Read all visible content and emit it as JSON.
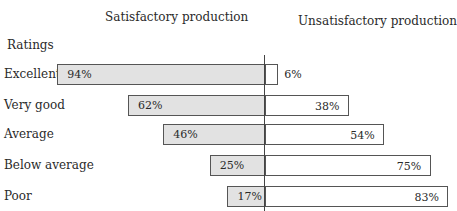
{
  "chart_data": {
    "type": "bar",
    "subtype": "diverging-horizontal",
    "title": "",
    "left_series_title": "Satisfactory production",
    "right_series_title": "Unsatisfactory production",
    "category_axis_title": "Ratings",
    "categories": [
      "Excellent",
      "Very good",
      "Average",
      "Below average",
      "Poor"
    ],
    "series": [
      {
        "name": "Satisfactory production",
        "values": [
          94,
          62,
          46,
          25,
          17
        ],
        "labels": [
          "94%",
          "62%",
          "46%",
          "25%",
          "17%"
        ],
        "color": "#e2e2e2"
      },
      {
        "name": "Unsatisfactory production",
        "values": [
          6,
          38,
          54,
          75,
          83
        ],
        "labels": [
          "6%",
          "38%",
          "54%",
          "75%",
          "83%"
        ],
        "color": "#ffffff"
      }
    ],
    "unit": "%",
    "xlim": [
      0,
      100
    ],
    "grid": false,
    "legend": "none (column headers above)"
  },
  "headers": {
    "left": "Satisfactory production",
    "right": "Unsatisfactory production",
    "ratings": "Ratings"
  }
}
